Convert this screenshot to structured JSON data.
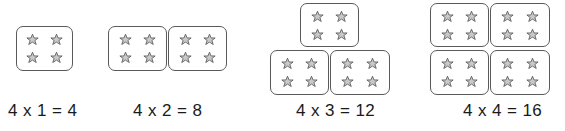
{
  "figure": {
    "star_icon": "star-outline-icon",
    "stars_per_box": 4,
    "star_stroke_color": "#5a5a5a",
    "star_fill_color": "#c9c9c9",
    "box_border_color": "#5a5a5a",
    "background_color": "#ffffff",
    "text_color": "#1a1a1a"
  },
  "groups": [
    {
      "id": "group-1",
      "equation": "4 x 1 = 4",
      "multiplicand": 4,
      "multiplier": 1,
      "product": 4,
      "box_count": 1,
      "layout": "single",
      "boxes": [
        {
          "left": 16,
          "top": 26,
          "width": 57,
          "height": 45
        }
      ],
      "eq_left": 8,
      "eq_top": 101
    },
    {
      "id": "group-2",
      "equation": "4 x 2 = 8",
      "multiplicand": 4,
      "multiplier": 2,
      "product": 8,
      "box_count": 2,
      "layout": "row-of-two",
      "boxes": [
        {
          "left": 108,
          "top": 26,
          "width": 59,
          "height": 45
        },
        {
          "left": 168,
          "top": 26,
          "width": 59,
          "height": 45
        }
      ],
      "eq_left": 133,
      "eq_top": 101
    },
    {
      "id": "group-3",
      "equation": "4 x 3 = 12",
      "multiplicand": 4,
      "multiplier": 3,
      "product": 12,
      "box_count": 3,
      "layout": "pyramid-one-over-two",
      "boxes": [
        {
          "left": 300,
          "top": 3,
          "width": 59,
          "height": 44
        },
        {
          "left": 270,
          "top": 50,
          "width": 59,
          "height": 45
        },
        {
          "left": 330,
          "top": 50,
          "width": 60,
          "height": 45
        }
      ],
      "eq_left": 296,
      "eq_top": 101
    },
    {
      "id": "group-4",
      "equation": "4 x 4 = 16",
      "multiplicand": 4,
      "multiplier": 4,
      "product": 16,
      "box_count": 4,
      "layout": "grid-two-by-two",
      "boxes": [
        {
          "left": 430,
          "top": 3,
          "width": 59,
          "height": 44
        },
        {
          "left": 490,
          "top": 3,
          "width": 60,
          "height": 44
        },
        {
          "left": 430,
          "top": 50,
          "width": 59,
          "height": 45
        },
        {
          "left": 490,
          "top": 50,
          "width": 60,
          "height": 45
        }
      ],
      "eq_left": 463,
      "eq_top": 101
    }
  ]
}
